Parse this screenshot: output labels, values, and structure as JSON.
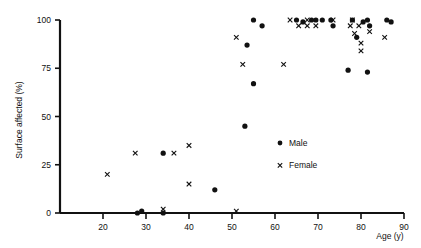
{
  "chart_data": {
    "type": "scatter",
    "title": "",
    "xlabel": "Age (y)",
    "ylabel": "Surface affected (%)",
    "xlim": [
      10,
      90
    ],
    "ylim": [
      0,
      100
    ],
    "xticks": [
      20,
      30,
      40,
      50,
      60,
      70,
      80,
      90
    ],
    "yticks": [
      0,
      25,
      50,
      75,
      100
    ],
    "xtick_labels": [
      "20",
      "30",
      "40",
      "50",
      "60",
      "70",
      "80",
      "90"
    ],
    "ytick_labels": [
      "0",
      "25",
      "50",
      "75",
      "100"
    ],
    "grid": false,
    "legend_position": "center-right",
    "series": [
      {
        "name": "Male",
        "marker": "filled-circle",
        "color": "#111111",
        "points": [
          [
            28.0,
            0
          ],
          [
            29.0,
            1
          ],
          [
            34.0,
            0
          ],
          [
            34.0,
            31
          ],
          [
            46.0,
            12
          ],
          [
            53.0,
            45
          ],
          [
            53.5,
            87
          ],
          [
            55.0,
            67
          ],
          [
            55.0,
            100
          ],
          [
            57.0,
            97
          ],
          [
            65.0,
            100
          ],
          [
            66.5,
            99
          ],
          [
            68.5,
            100
          ],
          [
            69.5,
            100
          ],
          [
            71.0,
            100
          ],
          [
            73.0,
            100
          ],
          [
            73.5,
            97
          ],
          [
            77.0,
            74
          ],
          [
            78.0,
            100
          ],
          [
            79.0,
            91
          ],
          [
            80.5,
            99
          ],
          [
            81.5,
            100
          ],
          [
            81.5,
            73
          ],
          [
            82.0,
            97
          ],
          [
            86.0,
            100
          ],
          [
            87.0,
            99
          ]
        ]
      },
      {
        "name": "Female",
        "marker": "x",
        "color": "#111111",
        "points": [
          [
            21.0,
            20
          ],
          [
            27.5,
            31
          ],
          [
            34.0,
            2
          ],
          [
            36.5,
            31
          ],
          [
            40.0,
            35
          ],
          [
            40.0,
            15
          ],
          [
            51.0,
            1
          ],
          [
            51.0,
            91
          ],
          [
            52.5,
            77
          ],
          [
            62.0,
            77
          ],
          [
            63.5,
            100
          ],
          [
            65.5,
            97
          ],
          [
            67.5,
            100
          ],
          [
            67.5,
            97
          ],
          [
            69.5,
            97
          ],
          [
            73.5,
            100
          ],
          [
            77.5,
            97
          ],
          [
            78.0,
            100
          ],
          [
            78.5,
            93
          ],
          [
            79.5,
            97
          ],
          [
            80.0,
            88
          ],
          [
            80.0,
            84
          ],
          [
            82.0,
            94
          ],
          [
            85.5,
            91
          ]
        ]
      }
    ]
  },
  "legend": {
    "male_label": "Male",
    "female_label": "Female"
  },
  "axes": {
    "y_title": "Surface affected (%)",
    "x_title": "Age (y)"
  }
}
